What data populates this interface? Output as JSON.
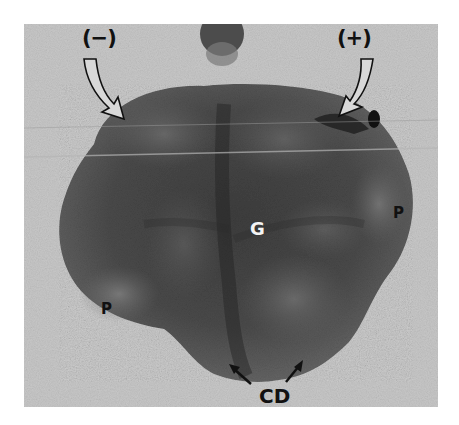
{
  "figure": {
    "colors": {
      "background_paper": "#ffffff",
      "photo_background": "#c9c9c9",
      "specimen_dark": "#3a3a3a",
      "specimen_mid": "#5e5e5e",
      "label_dark": "#111111",
      "label_light": "#f4f4f4"
    },
    "labels": {
      "negative_pole": "(−)",
      "positive_pole": "(+)",
      "center": "G",
      "right_lobe": "P",
      "left_lobe": "P",
      "bottom": "CD"
    },
    "arrows": {
      "negative_arrow": "hollow curved arrow pointing down-right",
      "positive_arrow": "hollow curved arrow pointing down-left",
      "cd_left_arrow": "solid arrow pointing up-left",
      "cd_right_arrow": "solid arrow pointing up-right"
    }
  }
}
